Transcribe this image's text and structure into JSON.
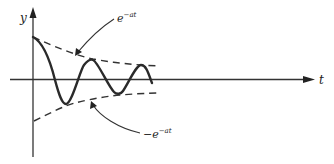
{
  "figure": {
    "type": "damped-oscillation-diagram",
    "axes": {
      "y_label": "y",
      "x_label": "t"
    },
    "labels": {
      "upper_envelope": {
        "base": "e",
        "exponent": "−at"
      },
      "lower_envelope": {
        "prefix": "−",
        "base": "e",
        "exponent": "−at"
      }
    },
    "curves": {
      "signal": "damped sinusoid",
      "upper_envelope": "e^{-at}",
      "lower_envelope": "-e^{-at}"
    },
    "colors": {
      "background": "#ffffff",
      "ink": "#2a2a2a"
    }
  }
}
